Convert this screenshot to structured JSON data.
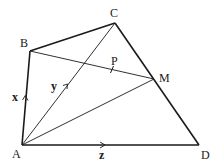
{
  "diagram": {
    "type": "geometry-quadrilateral-vectors",
    "points": {
      "A": {
        "label": "A",
        "x": 22,
        "y": 145,
        "lx": 12,
        "ly": 158
      },
      "B": {
        "label": "B",
        "x": 30,
        "y": 51,
        "lx": 20,
        "ly": 47
      },
      "C": {
        "label": "C",
        "x": 115,
        "y": 23,
        "lx": 110,
        "ly": 17
      },
      "D": {
        "label": "D",
        "x": 199,
        "y": 145,
        "lx": 201,
        "ly": 159
      },
      "M": {
        "label": "M",
        "x": 154,
        "y": 79,
        "lx": 159,
        "ly": 82
      },
      "P": {
        "label": "P",
        "x": 112,
        "y": 70,
        "lx": 111,
        "ly": 65
      }
    },
    "vectors": {
      "x": {
        "label": "x",
        "from": "A",
        "to": "B",
        "lx": 12,
        "ly": 101
      },
      "y": {
        "label": "y",
        "from": "A",
        "to": "C",
        "lx": 51,
        "ly": 90
      },
      "z": {
        "label": "z",
        "from": "A",
        "to": "D",
        "lx": 99,
        "ly": 159
      }
    },
    "edges_thick": [
      "AB",
      "BC",
      "CD",
      "AD"
    ],
    "edges_thin": [
      "AC",
      "AM",
      "BM"
    ],
    "colors": {
      "stroke": "#1a1a1a",
      "background": "#ffffff"
    }
  }
}
